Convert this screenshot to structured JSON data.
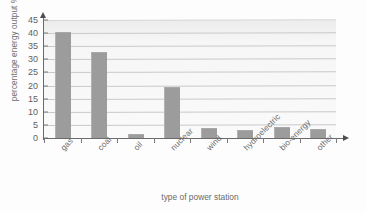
{
  "chart_data": {
    "type": "bar",
    "title": "",
    "xlabel": "type of power station",
    "ylabel": "percentage energy output %",
    "categories": [
      "gas",
      "coal",
      "oil",
      "nuclear",
      "wind",
      "hydroelectric",
      "bio-energy",
      "other"
    ],
    "values": [
      40,
      32.5,
      1,
      19,
      3.5,
      2.5,
      4,
      3
    ],
    "ylim": [
      0,
      45
    ],
    "ytick_labels": [
      "0",
      "5",
      "10",
      "15",
      "20",
      "25",
      "30",
      "35",
      "40",
      "45"
    ],
    "ytick_values": [
      0,
      5,
      10,
      15,
      20,
      25,
      30,
      35,
      40,
      45
    ],
    "grid": true,
    "legend": "none",
    "bar_color": "#9c9c9c",
    "axis_color": "#6a6a6a",
    "plot_bg": "#f6f6f7"
  }
}
